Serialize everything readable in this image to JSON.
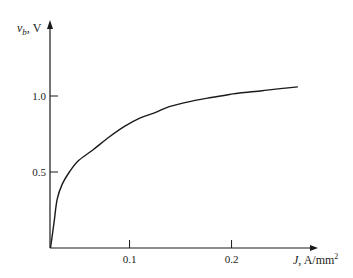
{
  "chart_data": {
    "type": "line",
    "title": "",
    "xlabel": {
      "symbol": "J",
      "unit": "A/mm",
      "unit_sup": "2"
    },
    "ylabel": {
      "symbol": "v",
      "subscript": "b",
      "unit": "V"
    },
    "xlim": [
      0.022,
      0.29
    ],
    "ylim": [
      0,
      1.6
    ],
    "x_ticks": [
      {
        "value": 0.1,
        "label": "0.1"
      },
      {
        "value": 0.2,
        "label": "0.2"
      }
    ],
    "y_ticks": [
      {
        "value": 0.5,
        "label": "0.5"
      },
      {
        "value": 1.0,
        "label": "1.0"
      }
    ],
    "grid": false,
    "legend": "none",
    "series": [
      {
        "name": "v_b vs J",
        "x": [
          0.0225,
          0.026,
          0.029,
          0.034,
          0.041,
          0.05,
          0.064,
          0.08,
          0.095,
          0.11,
          0.125,
          0.139,
          0.16,
          0.18,
          0.198,
          0.208,
          0.23,
          0.25,
          0.265
        ],
        "y": [
          0.0,
          0.17,
          0.32,
          0.42,
          0.5,
          0.575,
          0.645,
          0.73,
          0.8,
          0.855,
          0.89,
          0.93,
          0.965,
          0.99,
          1.01,
          1.02,
          1.035,
          1.05,
          1.06
        ]
      }
    ]
  }
}
